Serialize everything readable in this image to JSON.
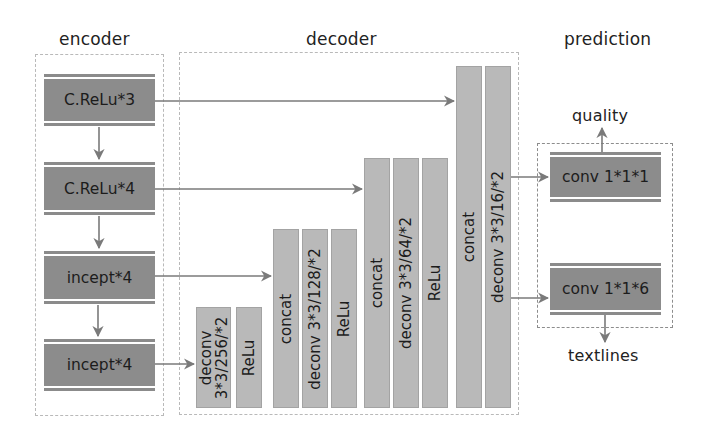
{
  "sections": {
    "encoder": "encoder",
    "decoder": "decoder",
    "prediction": "prediction"
  },
  "encoder": {
    "blocks": [
      {
        "label": "C.ReLu*3"
      },
      {
        "label": "C.ReLu*4"
      },
      {
        "label": "incept*4"
      },
      {
        "label": "incept*4"
      }
    ]
  },
  "decoder": {
    "stage1": {
      "deconv_line1": "deconv",
      "deconv_line2": "3*3/256/*2",
      "relu": "ReLu"
    },
    "stage2": {
      "concat": "concat",
      "deconv": "deconv 3*3/128/*2",
      "relu": "ReLu"
    },
    "stage3": {
      "concat": "concat",
      "deconv": "deconv 3*3/64/*2",
      "relu": "ReLu"
    },
    "stage4": {
      "concat": "concat",
      "deconv": "deconv 3*3/16/*2"
    }
  },
  "prediction": {
    "blocks": [
      {
        "label": "conv 1*1*1",
        "output": "quality"
      },
      {
        "label": "conv 1*1*6",
        "output": "textlines"
      }
    ]
  },
  "colors": {
    "dark_block": "#8c8c8c",
    "light_column": "#b9b9b9",
    "arrow": "#7a7a7a",
    "dashed_border": "#b9b9b9"
  }
}
